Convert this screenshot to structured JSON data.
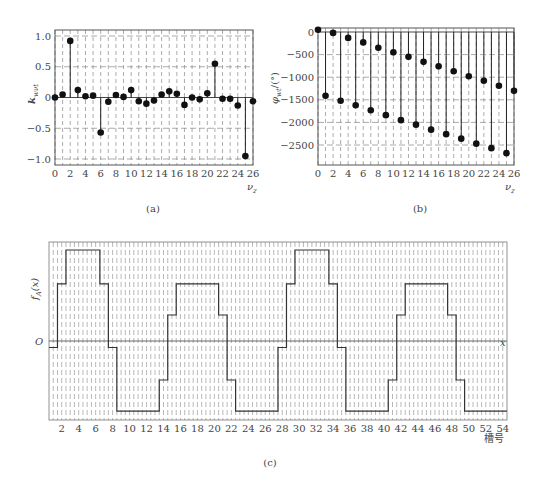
{
  "chart_data": [
    {
      "id": "a",
      "type": "stem",
      "caption": "(a)",
      "xlabel": "ν_z",
      "ylabel": "k_wνt",
      "xlim": [
        0,
        26
      ],
      "ylim": [
        -1.0,
        1.0
      ],
      "xticks": [
        0,
        2,
        4,
        6,
        8,
        10,
        12,
        14,
        16,
        18,
        20,
        22,
        24,
        26
      ],
      "yticks": [
        1.0,
        0.5,
        0,
        -0.5,
        -1.0
      ],
      "ytick_labels": [
        "1.0",
        "0.5",
        "0",
        "−0.5",
        "−1.0"
      ],
      "grid": true,
      "x": [
        0,
        1,
        2,
        3,
        4,
        5,
        6,
        7,
        8,
        9,
        10,
        11,
        12,
        13,
        14,
        15,
        16,
        17,
        18,
        19,
        20,
        21,
        22,
        23,
        24,
        25,
        26
      ],
      "values": [
        0,
        0.05,
        0.92,
        0.12,
        0.02,
        0.03,
        -0.57,
        -0.07,
        0.04,
        0.01,
        0.12,
        -0.06,
        -0.1,
        -0.05,
        0.05,
        0.1,
        0.06,
        -0.12,
        0.0,
        -0.03,
        0.07,
        0.55,
        -0.02,
        -0.02,
        -0.13,
        -0.95,
        -0.06
      ]
    },
    {
      "id": "b",
      "type": "stem",
      "caption": "(b)",
      "xlabel": "ν_z",
      "ylabel": "φ_wt/(°)",
      "xlim": [
        0,
        26
      ],
      "ylim": [
        -2950,
        50
      ],
      "xticks": [
        0,
        2,
        4,
        6,
        8,
        10,
        12,
        14,
        16,
        18,
        20,
        22,
        24,
        26
      ],
      "yticks": [
        0,
        -500,
        -1000,
        -1500,
        -2000,
        -2500
      ],
      "ytick_labels": [
        "0",
        "−500",
        "−1000",
        "−1500",
        "−2000",
        "−2500"
      ],
      "grid": true,
      "x": [
        0,
        1,
        2,
        3,
        4,
        5,
        6,
        7,
        8,
        9,
        10,
        11,
        12,
        13,
        14,
        15,
        16,
        17,
        18,
        19,
        20,
        21,
        22,
        23,
        24,
        25,
        26
      ],
      "values": [
        50,
        -1410,
        -20,
        -1520,
        -130,
        -1620,
        -230,
        -1730,
        -350,
        -1840,
        -450,
        -1950,
        -550,
        -2050,
        -660,
        -2160,
        -760,
        -2260,
        -870,
        -2360,
        -980,
        -2470,
        -1080,
        -2570,
        -1190,
        -2680,
        -1300
      ]
    },
    {
      "id": "c",
      "type": "step",
      "caption": "(c)",
      "xlabel": "槽号",
      "ylabel": "f_A(x)",
      "origin_label": "O",
      "axis_label": "x",
      "xlim": [
        1,
        54
      ],
      "xticks": [
        2,
        4,
        6,
        8,
        10,
        12,
        14,
        16,
        18,
        20,
        22,
        24,
        26,
        28,
        30,
        32,
        34,
        36,
        38,
        40,
        42,
        44,
        46,
        48,
        50,
        52,
        54
      ],
      "grid": true,
      "slots": [
        1,
        2,
        3,
        4,
        5,
        6,
        7,
        8,
        9,
        10,
        11,
        12,
        13,
        14,
        15,
        16,
        17,
        18,
        19,
        20,
        21,
        22,
        23,
        24,
        25,
        26,
        27,
        28,
        29,
        30,
        31,
        32,
        33,
        34,
        35,
        36,
        37,
        38,
        39,
        40,
        41,
        42,
        43,
        44,
        45,
        46,
        47,
        48,
        49,
        50,
        51,
        52,
        53,
        54
      ],
      "values": [
        -0.25,
        2.2,
        3.5,
        3.5,
        3.5,
        3.5,
        2.2,
        -0.25,
        -2.7,
        -2.7,
        -2.7,
        -2.7,
        -2.7,
        -1.5,
        1.0,
        2.2,
        2.2,
        2.2,
        2.2,
        2.2,
        1.0,
        -1.5,
        -2.7,
        -2.7,
        -2.7,
        -2.7,
        -2.7,
        -0.25,
        2.2,
        3.5,
        3.5,
        3.5,
        3.5,
        2.2,
        -0.25,
        -2.7,
        -2.7,
        -2.7,
        -2.7,
        -2.7,
        -1.5,
        1.0,
        2.2,
        2.2,
        2.2,
        2.2,
        2.2,
        1.0,
        -1.5,
        -2.7,
        -2.7,
        -2.7,
        -2.7,
        -2.7
      ]
    }
  ],
  "labels": {
    "a_caption": "(a)",
    "b_caption": "(b)",
    "c_caption": "(c)",
    "a_xlabel": "ν",
    "a_xlabel_sub": "z",
    "b_xlabel": "ν",
    "b_xlabel_sub": "z",
    "a_ylabel": "k",
    "a_ylabel_sub": "wνt",
    "b_ylabel": "φ",
    "b_ylabel_sub": "wt",
    "b_ylabel_unit": "/(°)",
    "c_ylabel": "f",
    "c_ylabel_sub": "A",
    "c_ylabel_arg": "(x)",
    "c_origin": "O",
    "c_axis": "x",
    "c_xlabel": "槽号"
  }
}
